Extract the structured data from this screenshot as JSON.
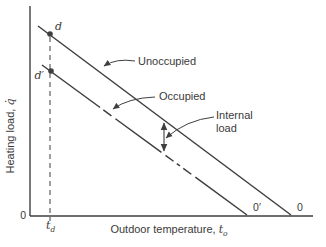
{
  "colors": {
    "line": "#3f3f3f",
    "text": "#3a3a3a",
    "background": "#ffffff"
  },
  "axis": {
    "y_label_text": "Heating load, ",
    "y_label_symbol": "q̇",
    "x_label_text": "Outdoor temperature, ",
    "x_label_symbol": "t",
    "x_label_subscript": "o",
    "origin_label": "0"
  },
  "labels": {
    "unoccupied": "Unoccupied",
    "occupied": "Occupied",
    "internal_line1": "Internal",
    "internal_line2": "load",
    "point_d": "d",
    "point_d_prime": "d′",
    "intercept_occupied": "0′",
    "intercept_unoccupied": "0",
    "design_temp_symbol": "t",
    "design_temp_subscript": "d"
  },
  "chart_data": {
    "type": "line",
    "title": "",
    "xlabel": "Outdoor temperature, t_o",
    "ylabel": "Heating load, q̇",
    "qualitative": true,
    "series": [
      {
        "name": "Unoccupied",
        "style": "solid",
        "points_px": [
          [
            38,
            26
          ],
          [
            291,
            215
          ]
        ],
        "design_point": "d",
        "x_intercept_label": "0"
      },
      {
        "name": "Occupied",
        "style": "solid with dashed mid-sections",
        "points_px": [
          [
            42,
            65
          ],
          [
            247,
            215
          ]
        ],
        "design_point": "d′",
        "x_intercept_label": "0′"
      }
    ],
    "annotations": [
      {
        "text": "Internal load",
        "meaning": "vertical distance between the two lines"
      },
      {
        "text": "t_d",
        "meaning": "design outdoor temperature at dashed guide line"
      }
    ],
    "geometry_px": {
      "lines": [
        {
          "x1": 30,
          "y1": 6,
          "x2": 30,
          "y2": 216,
          "w": 1.4
        },
        {
          "x1": 30,
          "y1": 216,
          "x2": 313,
          "y2": 216,
          "w": 1.4
        },
        {
          "x1": 38,
          "y1": 26,
          "x2": 291,
          "y2": 215,
          "w": 1.5
        },
        {
          "x1": 42,
          "y1": 65,
          "x2": 247,
          "y2": 215,
          "w": 1.5,
          "dash": "72 4 10 5 57 5 10 4 4 4 10 5 64"
        },
        {
          "x1": 50,
          "y1": 37,
          "x2": 50,
          "y2": 221,
          "w": 1,
          "dash": "5 4"
        },
        {
          "x1": 164,
          "y1": 137,
          "x2": 164,
          "y2": 123,
          "w": 1.1,
          "arrow_end": true
        },
        {
          "x1": 164,
          "y1": 137,
          "x2": 164,
          "y2": 151,
          "w": 1.1,
          "arrow_end": true
        }
      ],
      "paths": [
        {
          "d": "M135,61 Q116,58 104,66",
          "w": 1,
          "arrow_end": true
        },
        {
          "d": "M155,97 Q128,98 113,109",
          "w": 1,
          "arrow_end": true
        },
        {
          "d": "M214,117 Q186,120 166,138",
          "w": 1,
          "arrow_end": true
        }
      ],
      "points": [
        {
          "cx": 50,
          "cy": 34,
          "r": 2.8
        },
        {
          "cx": 51,
          "cy": 71,
          "r": 2.8
        }
      ]
    }
  }
}
